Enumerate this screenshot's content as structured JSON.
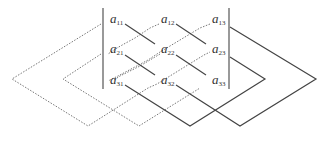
{
  "colors": {
    "line": "#444444",
    "dotted": "#777777"
  },
  "matrix": {
    "rows": [
      [
        {
          "base": "a",
          "sub": "11"
        },
        {
          "base": "a",
          "sub": "12"
        },
        {
          "base": "a",
          "sub": "13"
        }
      ],
      [
        {
          "base": "a",
          "sub": "21"
        },
        {
          "base": "a",
          "sub": "22"
        },
        {
          "base": "a",
          "sub": "23"
        }
      ],
      [
        {
          "base": "a",
          "sub": "31"
        },
        {
          "base": "a",
          "sub": "32"
        },
        {
          "base": "a",
          "sub": "33"
        }
      ]
    ]
  },
  "legend": {
    "solid": "positive products",
    "dotted": "negative products"
  }
}
